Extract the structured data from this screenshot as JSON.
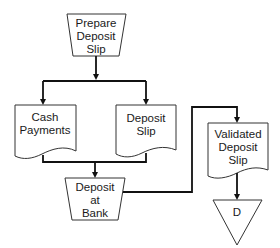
{
  "diagram": {
    "type": "document-flowchart",
    "nodes": {
      "prepare": {
        "shape": "manual-operation",
        "lines": [
          "Prepare",
          "Deposit",
          "Slip"
        ]
      },
      "cash": {
        "shape": "document",
        "lines": [
          "Cash",
          "Payments"
        ]
      },
      "slip": {
        "shape": "document",
        "lines": [
          "Deposit",
          "Slip"
        ]
      },
      "bank": {
        "shape": "manual-operation",
        "lines": [
          "Deposit",
          "at",
          "Bank"
        ]
      },
      "validated": {
        "shape": "document",
        "lines": [
          "Validated",
          "Deposit",
          "Slip"
        ]
      },
      "file": {
        "shape": "offline-storage-triangle",
        "label": "D"
      }
    },
    "edges": [
      {
        "from": "Prepare Deposit Slip",
        "to": "Cash Payments"
      },
      {
        "from": "Prepare Deposit Slip",
        "to": "Deposit Slip"
      },
      {
        "from": "Cash Payments",
        "to": "Deposit at Bank"
      },
      {
        "from": "Deposit Slip",
        "to": "Deposit at Bank"
      },
      {
        "from": "Deposit at Bank",
        "to": "Validated Deposit Slip"
      },
      {
        "from": "Validated Deposit Slip",
        "to": "D"
      }
    ],
    "colors": {
      "line": "#111111",
      "shape_stroke": "#333333",
      "background": "#ffffff"
    }
  }
}
